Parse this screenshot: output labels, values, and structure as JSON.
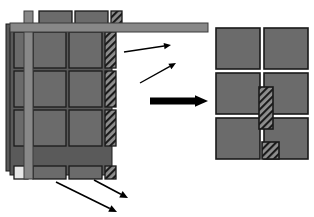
{
  "figure": {
    "kind": "technical-diagram",
    "background_color": "#ffffff"
  },
  "palette": {
    "panel_fill": "#6b6b6b",
    "panel_edge": "#1a1a1a",
    "band_fill": "#888888",
    "band_edge": "#3a3a3a",
    "hatch_fill": "#8e8e8e",
    "hatch_line": "#1a1a1a",
    "white_cell": "#e8e8e8",
    "arrow_color": "#000000",
    "shadow_fill": "#5a5a5a"
  },
  "left_assembly": {
    "label": "source-assembly",
    "columns": [
      {
        "name": "narrow-left-column",
        "x": 14,
        "width": 14
      },
      {
        "name": "wide-center-column-a",
        "x": 33,
        "width": 33
      },
      {
        "name": "wide-center-column-b",
        "x": 69,
        "width": 33
      },
      {
        "name": "hatched-right-column",
        "x": 105,
        "width": 11,
        "hatched": true
      }
    ],
    "rows": [
      {
        "name": "raised-top-row",
        "y": 11,
        "height": 14,
        "raised": true
      },
      {
        "name": "row-1",
        "y": 32,
        "height": 36
      },
      {
        "name": "row-2",
        "y": 71,
        "height": 36
      },
      {
        "name": "row-3",
        "y": 110,
        "height": 36
      },
      {
        "name": "thin-bottom-row",
        "y": 166,
        "height": 13
      }
    ],
    "vertical_band": {
      "name": "vertical-cross-band",
      "x": 24,
      "width": 9
    },
    "horizontal_band": {
      "name": "horizontal-cross-band",
      "y": 23,
      "height": 9
    },
    "top_extension_bar": {
      "name": "top-extension-bar",
      "x": 116,
      "y": 23,
      "width": 86,
      "height": 9
    },
    "white_cell": {
      "name": "white-corner-cell",
      "x": 14,
      "y": 166,
      "width": 14,
      "height": 13
    },
    "step_shadow_offsets": [
      4,
      8
    ]
  },
  "right_assembly": {
    "label": "result-grid",
    "cols": 2,
    "rows": 3,
    "cell_width": 44,
    "cell_height": 41,
    "origin": {
      "x": 216,
      "y": 28
    },
    "gap": 4,
    "inserts": [
      {
        "name": "tall-hatched-insert",
        "x": 259,
        "y": 87,
        "width": 14,
        "height": 42
      },
      {
        "name": "small-hatched-insert",
        "x": 262,
        "y": 142,
        "width": 17,
        "height": 17
      }
    ]
  },
  "arrows": [
    {
      "name": "callout-arrow-upper",
      "x1": 124,
      "y1": 52,
      "x2": 171,
      "y2": 45,
      "head": 7,
      "width": 1.4
    },
    {
      "name": "callout-arrow-lower",
      "x1": 140,
      "y1": 83,
      "x2": 176,
      "y2": 63,
      "head": 7,
      "width": 1.4
    },
    {
      "name": "main-transform-arrow",
      "x1": 150,
      "y1": 101,
      "x2": 208,
      "y2": 101,
      "head": 13,
      "width": 7
    },
    {
      "name": "callout-arrow-bottom-left",
      "x1": 56,
      "y1": 182,
      "x2": 117,
      "y2": 212,
      "head": 8,
      "width": 1.6
    },
    {
      "name": "callout-arrow-bottom-right",
      "x1": 94,
      "y1": 180,
      "x2": 128,
      "y2": 198,
      "head": 8,
      "width": 1.6
    }
  ]
}
